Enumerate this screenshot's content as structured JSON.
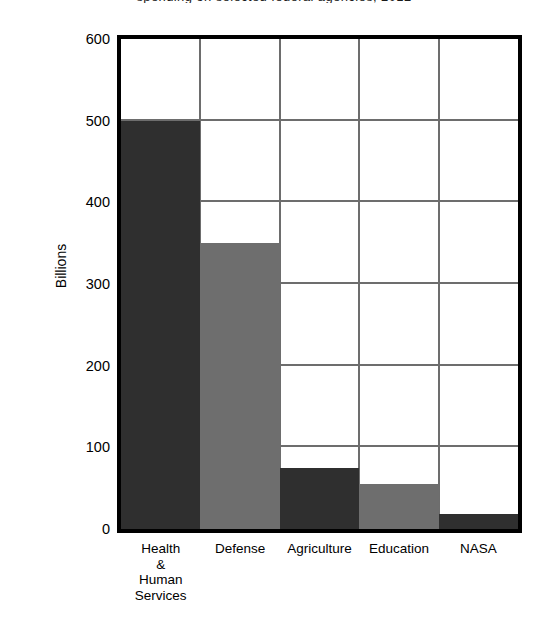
{
  "figure": {
    "clipped_title": "spending on selected federal agencies, 2012",
    "background": "#ffffff"
  },
  "axes": {
    "ylabel": "Billions",
    "yticks": [
      "0",
      "100",
      "200",
      "300",
      "400",
      "500",
      "600"
    ],
    "xticks": [
      {
        "lines": [
          "Health",
          "&",
          "Human",
          "Services"
        ]
      },
      {
        "lines": [
          "Defense"
        ]
      },
      {
        "lines": [
          "Agriculture"
        ]
      },
      {
        "lines": [
          "Education"
        ]
      },
      {
        "lines": [
          "NASA"
        ]
      }
    ]
  },
  "colors": {
    "bar_dark": "#2f2f2f",
    "bar_light": "#6e6e6e",
    "frame": "#000000",
    "gridline": "#6d6d6d",
    "plot_background": "#ffffff"
  },
  "chart_data": {
    "type": "bar",
    "title": "spending on selected federal agencies, 2012",
    "xlabel": "",
    "ylabel": "Billions",
    "categories": [
      "Health & Human Services",
      "Defense",
      "Agriculture",
      "Education",
      "NASA"
    ],
    "values": [
      500,
      350,
      75,
      55,
      18
    ],
    "bar_colors": [
      "#2f2f2f",
      "#6e6e6e",
      "#2f2f2f",
      "#6e6e6e",
      "#2f2f2f"
    ],
    "ylim": [
      0,
      600
    ],
    "ytick_values": [
      0,
      100,
      200,
      300,
      400,
      500,
      600
    ],
    "grid": "both",
    "legend": "none",
    "bar_width_fraction": 1.0,
    "units": "billions of dollars"
  }
}
